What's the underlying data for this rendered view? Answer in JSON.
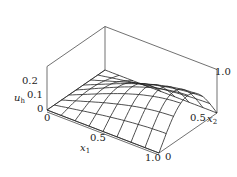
{
  "chart_data": {
    "type": "surface3d",
    "title": "",
    "xlabel": "x1",
    "ylabel": "x2",
    "zlabel": "u_h",
    "x_ticks": [
      "0",
      "0.5",
      "1.0"
    ],
    "y_ticks": [
      "0",
      "0.5",
      "1.0"
    ],
    "z_ticks": [
      "0",
      "0.1",
      "0.2"
    ],
    "xlim": [
      0,
      1
    ],
    "ylim": [
      0,
      1
    ],
    "zlim": [
      0,
      0.3
    ],
    "grid_resolution": [
      8,
      8
    ],
    "surface_description": "wireframe mesh, zero on x1=0, x2=0 and x2=1 edges, rising toward x1=1 with maximum about 0.25 near x1=1, x2=0.5",
    "box": true,
    "grid": false,
    "legend": "none"
  },
  "labels": {
    "z_tick_0": "0",
    "z_tick_1": "0.1",
    "z_tick_2": "0.2",
    "z_axis_name": "u",
    "z_axis_sub": "h",
    "x_tick_0": "0",
    "x_tick_1": "0.5",
    "x_tick_2": "1.0",
    "x_axis_name": "x",
    "x_axis_sub": "1",
    "y_tick_0": "0",
    "y_tick_1": "0.5",
    "y_tick_2": "1.0",
    "y_axis_name": "x",
    "y_axis_sub": "2"
  }
}
